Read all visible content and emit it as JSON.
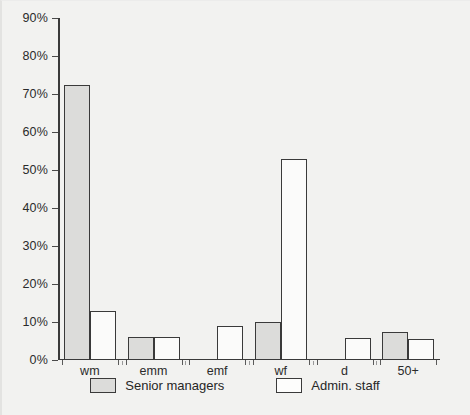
{
  "chart_data": {
    "type": "bar",
    "title": "",
    "subtitle": "",
    "xlabel": "",
    "ylabel": "",
    "categories": [
      "wm",
      "emm",
      "emf",
      "wf",
      "d",
      "50+"
    ],
    "series": [
      {
        "name": "Senior managers",
        "fill": "#dcdcda",
        "values": [
          72.5,
          6,
          0,
          10,
          0,
          7.5
        ]
      },
      {
        "name": "Admin. staff",
        "fill": "#fbfbfa",
        "values": [
          13,
          6,
          9,
          53,
          5.8,
          5.5
        ]
      }
    ],
    "ylim": [
      0,
      90
    ],
    "yticks": [
      0,
      10,
      20,
      30,
      40,
      50,
      60,
      70,
      80,
      90
    ],
    "ytick_labels": [
      "0%",
      "10%",
      "20%",
      "30%",
      "40%",
      "50%",
      "60%",
      "70%",
      "80%",
      "90%"
    ],
    "grid": false,
    "legend_position": "bottom",
    "units": "percent",
    "colors": {
      "background": "#f2f2f0",
      "axis": "#3a3a3a",
      "text": "#2b2b2b",
      "series_senior_managers": "#dcdcda",
      "series_admin_staff": "#fbfbfa"
    }
  }
}
